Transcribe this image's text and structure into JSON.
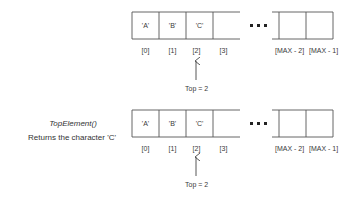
{
  "diagrams": [
    {
      "cells": [
        "'A'",
        "'B'",
        "'C'",
        ""
      ],
      "end_cells": [
        "",
        ""
      ],
      "indices": [
        "[0]",
        "[1]",
        "[2]",
        "[3]"
      ],
      "end_indices": [
        "[MAX - 2]",
        "[MAX - 1]"
      ],
      "ellipsis": "• • •",
      "pointer_label": "Top = 2"
    },
    {
      "caption_title": "TopElement()",
      "caption_desc": "Returns the character 'C'",
      "cells": [
        "'A'",
        "'B'",
        "'C'",
        ""
      ],
      "end_cells": [
        "",
        ""
      ],
      "indices": [
        "[0]",
        "[1]",
        "[2]",
        "[3]"
      ],
      "end_indices": [
        "[MAX - 2]",
        "[MAX - 1]"
      ],
      "ellipsis": "• • •",
      "pointer_label": "Top = 2"
    }
  ],
  "colors": {
    "stroke": "#555555",
    "text": "#333333",
    "background": "#ffffff"
  }
}
